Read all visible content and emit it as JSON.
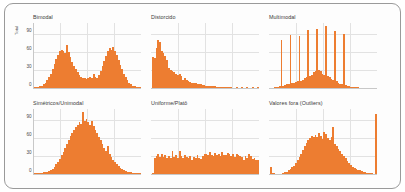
{
  "figure": {
    "yaxis_title": "Total",
    "bar_color": "#ED7D31",
    "grid_color": "#e2e2e2",
    "frame_color": "#9a9a9a"
  },
  "chart_data": {
    "type": "bar",
    "title": "",
    "xlabel": "",
    "ylabel": "Total",
    "ylim": [
      0,
      110
    ],
    "yticks": [
      0,
      30,
      60,
      90
    ],
    "grid": true,
    "legend": "none",
    "layout": "2 rows x 3 columns of small-multiple histograms",
    "panels": [
      {
        "title": "Bimodal",
        "row": 0,
        "col": 0,
        "ylim": [
          0,
          110
        ],
        "yticks": [
          0,
          30,
          60,
          90
        ],
        "values": [
          1,
          1,
          2,
          3,
          4,
          6,
          9,
          13,
          18,
          24,
          31,
          40,
          48,
          55,
          61,
          64,
          62,
          58,
          72,
          60,
          52,
          44,
          37,
          31,
          26,
          22,
          19,
          17,
          16,
          15,
          16,
          18,
          17,
          24,
          19,
          16,
          22,
          28,
          36,
          45,
          54,
          61,
          66,
          63,
          68,
          62,
          55,
          47,
          39,
          31,
          24,
          18,
          13,
          9,
          6,
          4,
          3,
          2,
          2,
          1
        ]
      },
      {
        "title": "Distorcido",
        "row": 0,
        "col": 1,
        "ylim": [
          0,
          110
        ],
        "yticks": [
          0,
          30,
          60,
          90
        ],
        "values": [
          52,
          50,
          66,
          80,
          76,
          62,
          58,
          54,
          46,
          34,
          30,
          28,
          26,
          24,
          22,
          23,
          20,
          13,
          16,
          14,
          12,
          10,
          9,
          8,
          8,
          7,
          6,
          6,
          5,
          5,
          4,
          4,
          4,
          3,
          3,
          3,
          2,
          2,
          2,
          2,
          1,
          1,
          1,
          1,
          1,
          0,
          0,
          1,
          0,
          0,
          1,
          0,
          0,
          1,
          0,
          0,
          1,
          0,
          0,
          1
        ]
      },
      {
        "title": "Multimodal",
        "row": 0,
        "col": 2,
        "ylim": [
          0,
          110
        ],
        "yticks": [
          0,
          30,
          60,
          90
        ],
        "values": [
          0,
          0,
          1,
          1,
          2,
          3,
          80,
          4,
          5,
          6,
          7,
          88,
          8,
          9,
          10,
          11,
          86,
          12,
          14,
          16,
          18,
          96,
          20,
          22,
          26,
          28,
          99,
          30,
          28,
          24,
          22,
          103,
          20,
          18,
          15,
          13,
          95,
          11,
          9,
          7,
          6,
          90,
          5,
          4,
          3,
          2,
          2,
          1,
          1,
          1,
          0,
          0,
          0,
          0,
          0,
          0,
          0,
          0,
          0,
          0
        ]
      },
      {
        "title": "Simétricos/Unimodal",
        "row": 1,
        "col": 0,
        "ylim": [
          0,
          110
        ],
        "yticks": [
          0,
          30,
          60,
          90
        ],
        "values": [
          1,
          1,
          1,
          2,
          2,
          3,
          3,
          4,
          5,
          7,
          9,
          12,
          16,
          20,
          25,
          31,
          37,
          44,
          50,
          57,
          63,
          68,
          73,
          78,
          81,
          86,
          84,
          103,
          88,
          92,
          86,
          82,
          88,
          80,
          74,
          68,
          62,
          56,
          50,
          44,
          38,
          46,
          34,
          28,
          24,
          20,
          16,
          13,
          10,
          8,
          6,
          5,
          4,
          3,
          3,
          2,
          2,
          1,
          1,
          1
        ]
      },
      {
        "title": "Uniforme/Platô",
        "row": 1,
        "col": 1,
        "ylim": [
          0,
          110
        ],
        "yticks": [
          0,
          30,
          60,
          90
        ],
        "values": [
          2,
          26,
          30,
          33,
          29,
          34,
          28,
          31,
          27,
          30,
          26,
          38,
          29,
          32,
          27,
          38,
          30,
          26,
          31,
          28,
          27,
          30,
          24,
          29,
          26,
          31,
          27,
          25,
          30,
          34,
          33,
          31,
          36,
          32,
          30,
          35,
          31,
          34,
          30,
          36,
          32,
          31,
          35,
          33,
          30,
          34,
          29,
          33,
          31,
          30,
          28,
          24,
          30,
          26,
          33,
          30,
          25,
          27,
          24,
          23
        ]
      },
      {
        "title": "Valores fora (Outliers)",
        "row": 1,
        "col": 2,
        "ylim": [
          0,
          110
        ],
        "yticks": [
          0,
          30,
          60,
          90
        ],
        "values": [
          12,
          2,
          1,
          0,
          0,
          0,
          0,
          2,
          3,
          4,
          6,
          8,
          11,
          14,
          18,
          23,
          28,
          34,
          40,
          46,
          52,
          57,
          60,
          63,
          62,
          65,
          61,
          68,
          64,
          58,
          70,
          66,
          60,
          56,
          62,
          78,
          50,
          46,
          42,
          38,
          34,
          30,
          26,
          22,
          18,
          15,
          12,
          10,
          8,
          7,
          6,
          5,
          4,
          3,
          2,
          2,
          1,
          1,
          0,
          100
        ]
      }
    ]
  }
}
